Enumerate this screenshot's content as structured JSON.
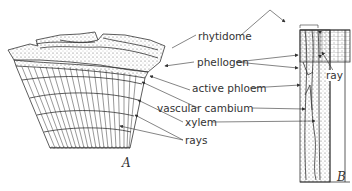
{
  "figure": {
    "panel_a_label": "A",
    "panel_b_label": "B",
    "labels": {
      "rhytidome": "rhytidome",
      "phellogen": "phellogen",
      "active_phloem": "active phloem",
      "vascular_cambium": "vascular cambium",
      "xylem": "xylem",
      "rays": "rays",
      "ray": "ray"
    }
  }
}
